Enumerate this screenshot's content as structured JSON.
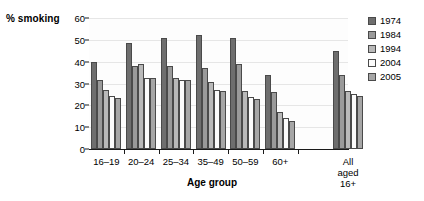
{
  "chart_data": {
    "type": "bar",
    "title": "",
    "xlabel": "Age group",
    "ylabel": "% smoking",
    "ylim": [
      0,
      60
    ],
    "yticks": [
      0,
      10,
      20,
      30,
      40,
      50,
      60
    ],
    "grid": true,
    "legend_position": "right",
    "categories": [
      "16–19",
      "20–24",
      "25–34",
      "35–49",
      "50–59",
      "60+",
      "All aged 16+"
    ],
    "series": [
      {
        "name": "1974",
        "color": "#6e6e6e",
        "values": [
          40,
          48.5,
          51,
          52,
          51,
          34,
          45
        ]
      },
      {
        "name": "1984",
        "color": "#9a9a9a",
        "values": [
          31.5,
          38,
          38,
          37,
          39,
          26,
          34
        ]
      },
      {
        "name": "1994",
        "color": "#b9b9b9",
        "values": [
          27,
          39,
          32.5,
          30.5,
          26.5,
          17,
          26.5
        ]
      },
      {
        "name": "2004",
        "color": "#fbfbfb",
        "values": [
          24.5,
          32.5,
          31.5,
          27,
          24,
          14,
          25
        ]
      },
      {
        "name": "2005",
        "color": "#a6a6a6",
        "values": [
          23.5,
          32.5,
          31.5,
          26.5,
          23,
          13,
          24.5
        ]
      }
    ]
  },
  "legend": {
    "items": [
      {
        "label": "1974"
      },
      {
        "label": "1984"
      },
      {
        "label": "1994"
      },
      {
        "label": "2004"
      },
      {
        "label": "2005"
      }
    ]
  }
}
